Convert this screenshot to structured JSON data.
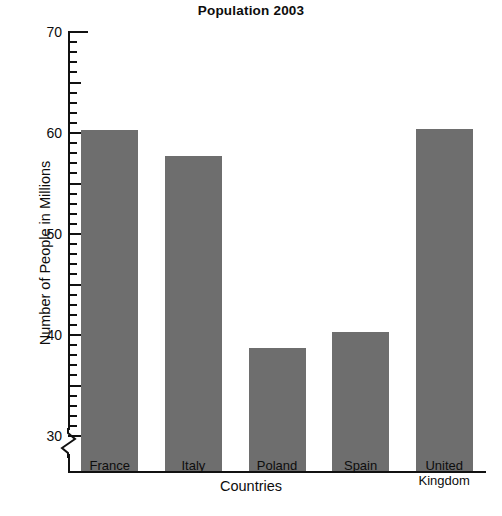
{
  "chart_data": {
    "type": "bar",
    "title": "Population 2003",
    "xlabel": "Countries",
    "ylabel": "Number of People in Millions",
    "categories": [
      "France",
      "Italy",
      "Poland",
      "Spain",
      "United Kingdom"
    ],
    "values": [
      60.3,
      57.7,
      38.7,
      40.3,
      60.4
    ],
    "ylim": [
      28.8,
      70
    ],
    "y_axis_break": true,
    "y_major_ticks": [
      30,
      40,
      50,
      60,
      70
    ],
    "y_major_tick_labels": [
      "30",
      "40",
      "50",
      "60",
      "70"
    ],
    "y_minor_tick_step": 1,
    "y_mid_tick_step": 5,
    "grid": false,
    "legend": false,
    "bar_color": "#6e6e6e",
    "axis_color": "#111111",
    "text_color": "#0d0d0d",
    "background_color": "#ffffff"
  },
  "category_lines": [
    [
      "France"
    ],
    [
      "Italy"
    ],
    [
      "Poland"
    ],
    [
      "Spain"
    ],
    [
      "United",
      "Kingdom"
    ]
  ]
}
